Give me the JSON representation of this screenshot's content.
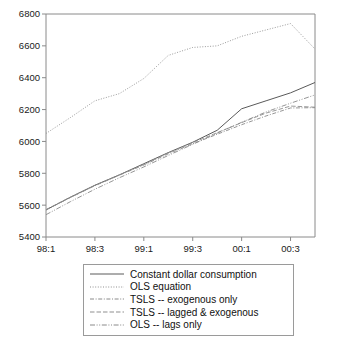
{
  "chart_data": {
    "type": "line",
    "title": "",
    "subtitle": "",
    "xlabel": "",
    "ylabel": "",
    "grid": false,
    "legend_position": "bottom",
    "ylim": [
      5400,
      6800
    ],
    "ytick_labels": [
      "5400",
      "5600",
      "5800",
      "6000",
      "6200",
      "6400",
      "6600",
      "6800"
    ],
    "ytick_values": [
      5400,
      5600,
      5800,
      6000,
      6200,
      6400,
      6600,
      6800
    ],
    "xtick_labels": [
      "98:1",
      "98:3",
      "99:1",
      "99:3",
      "00:1",
      "00:3"
    ],
    "x": [
      "98:1",
      "98:2",
      "98:3",
      "98:4",
      "99:1",
      "99:2",
      "99:3",
      "99:4",
      "00:1",
      "00:2",
      "00:3",
      "00:4"
    ],
    "series": [
      {
        "name": "Constant dollar consumption",
        "style": "solid",
        "values": [
          5570,
          5650,
          5725,
          5790,
          5860,
          5930,
          5995,
          6070,
          6205,
          6255,
          6305,
          6370
        ]
      },
      {
        "name": "OLS equation",
        "style": "dotted",
        "values": [
          6050,
          6150,
          6255,
          6300,
          6395,
          6540,
          6590,
          6600,
          6660,
          6700,
          6740,
          6580
        ]
      },
      {
        "name": "TSLS -- exogenous only",
        "style": "dash-dot",
        "values": [
          5570,
          5648,
          5722,
          5788,
          5852,
          5922,
          5985,
          6045,
          6105,
          6160,
          6210,
          6212
        ]
      },
      {
        "name": "TSLS -- lagged & exogenous",
        "style": "dashed",
        "values": [
          5572,
          5650,
          5724,
          5790,
          5855,
          5928,
          5992,
          6055,
          6118,
          6178,
          6222,
          6215
        ]
      },
      {
        "name": "OLS -- lags only",
        "style": "dash-dot-dot",
        "values": [
          5540,
          5622,
          5700,
          5772,
          5840,
          5912,
          5982,
          6052,
          6120,
          6185,
          6240,
          6292
        ]
      }
    ]
  },
  "legend": {
    "items": [
      {
        "label": "Constant dollar consumption",
        "style": "solid"
      },
      {
        "label": "OLS equation",
        "style": "dotted"
      },
      {
        "label": "TSLS -- exogenous only",
        "style": "dash-dot"
      },
      {
        "label": "TSLS -- lagged & exogenous",
        "style": "dashed"
      },
      {
        "label": "OLS -- lags only",
        "style": "dash-dot-dot"
      }
    ]
  },
  "colors": {
    "axis": "#8a8a8a",
    "text": "#1a1a1a",
    "series_solid": "#5a5a5a",
    "series_light": "#8f8f8f",
    "background": "#ffffff"
  }
}
